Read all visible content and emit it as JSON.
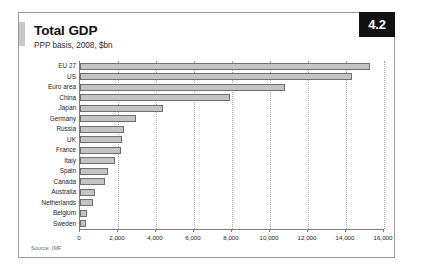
{
  "card": {
    "title": "Total GDP",
    "subtitle": "PPP basis, 2008, $bn",
    "badge": "4.2",
    "source": "Source: IMF"
  },
  "chart_data": {
    "type": "bar",
    "orientation": "horizontal",
    "title": "Total GDP",
    "subtitle": "PPP basis, 2008, $bn",
    "xlabel": "",
    "ylabel": "",
    "xlim": [
      0,
      16000
    ],
    "xticks": [
      0,
      2000,
      4000,
      6000,
      8000,
      10000,
      12000,
      14000,
      16000
    ],
    "xtick_labels": [
      "0",
      "2,000",
      "4,000",
      "6,000",
      "8,000",
      "10,000",
      "12,000",
      "14,000",
      "16,000"
    ],
    "grid": "vertical-dotted",
    "legend": "none",
    "bar_color": "#c4c4c4",
    "bar_edge_color": "#6f6f6f",
    "categories": [
      "EU 27",
      "US",
      "Euro area",
      "China",
      "Japan",
      "Germany",
      "Russia",
      "UK",
      "France",
      "Italy",
      "Spain",
      "Canada",
      "Australia",
      "Netherlands",
      "Belgium",
      "Sweden"
    ],
    "values": [
      15250,
      14300,
      10800,
      7900,
      4350,
      2925,
      2290,
      2230,
      2135,
      1830,
      1450,
      1300,
      800,
      675,
      390,
      340
    ]
  }
}
